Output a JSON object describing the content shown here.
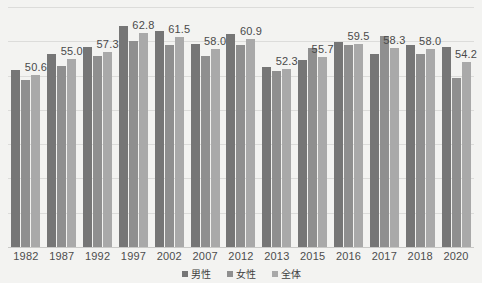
{
  "chart_data": {
    "type": "bar",
    "title": "",
    "xlabel": "",
    "ylabel": "",
    "grid": true,
    "legend_position": "bottom",
    "ylim": [
      0,
      70
    ],
    "gridline_values": [
      0,
      10,
      20,
      30,
      40,
      50,
      60,
      70
    ],
    "categories": [
      "1982",
      "1987",
      "1992",
      "1997",
      "2002",
      "2007",
      "2012",
      "2013",
      "2015",
      "2016",
      "2017",
      "2018",
      "2020"
    ],
    "series": [
      {
        "name": "男性",
        "color": "#767676",
        "values": [
          51.9,
          56.6,
          58.5,
          64.9,
          63.4,
          59.6,
          62.3,
          52.9,
          54.9,
          60.0,
          56.6,
          59.3,
          58.5
        ]
      },
      {
        "name": "女性",
        "color": "#8f8f8f",
        "values": [
          48.9,
          53.2,
          55.9,
          60.5,
          59.3,
          56.1,
          59.3,
          51.5,
          58.3,
          59.3,
          61.7,
          56.7,
          49.5
        ]
      },
      {
        "name": "全体",
        "color": "#a9a9a9",
        "values": [
          50.6,
          55.0,
          57.3,
          62.8,
          61.5,
          58.0,
          60.9,
          52.3,
          55.7,
          59.5,
          58.3,
          58.0,
          54.2
        ]
      }
    ],
    "data_labels": {
      "series": "全体",
      "values": [
        "50.6",
        "55.0",
        "57.3",
        "62.8",
        "61.5",
        "58.0",
        "60.9",
        "52.3",
        "55.7",
        "59.5",
        "58.3",
        "58.0",
        "54.2"
      ]
    }
  },
  "legend": {
    "items": [
      {
        "label": "男性",
        "color": "#767676"
      },
      {
        "label": "女性",
        "color": "#8f8f8f"
      },
      {
        "label": "全体",
        "color": "#a9a9a9"
      }
    ]
  },
  "colors": {
    "background": "#f3f3f1",
    "gridline": "#dcdcda",
    "axis": "#c9c9c7",
    "label_text": "#4a4a4a"
  }
}
